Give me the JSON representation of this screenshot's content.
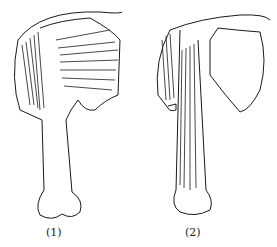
{
  "figures": [
    {
      "label": "(1)",
      "description": "shoulder with deltoid-like muscle fibers and humerus bone"
    },
    {
      "label": "(2)",
      "description": "shoulder with scapula and biceps-like muscles along upper arm"
    }
  ],
  "colors": {
    "ink": "#1a1a1a",
    "background": "#ffffff"
  }
}
